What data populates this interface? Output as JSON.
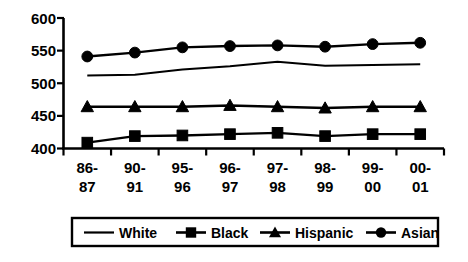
{
  "chart_data": {
    "type": "line",
    "title": "",
    "subtitle": "",
    "xlabel": "",
    "ylabel": "",
    "categories": [
      "86-\n87",
      "90-\n91",
      "95-\n96",
      "96-\n97",
      "97-\n98",
      "98-\n99",
      "99-\n00",
      "00-\n01"
    ],
    "category_lines": [
      [
        "86-",
        "87"
      ],
      [
        "90-",
        "91"
      ],
      [
        "95-",
        "96"
      ],
      [
        "96-",
        "97"
      ],
      [
        "97-",
        "98"
      ],
      [
        "98-",
        "99"
      ],
      [
        "99-",
        "00"
      ],
      [
        "00-",
        "01"
      ]
    ],
    "ylim": [
      400,
      600
    ],
    "ytick_values": [
      400,
      450,
      500,
      550,
      600
    ],
    "ytick_labels": [
      "400",
      "450",
      "500",
      "550",
      "600"
    ],
    "grid": false,
    "legend_position": "bottom",
    "series": [
      {
        "name": "White",
        "marker": "none",
        "color": "#000000",
        "values": [
          512,
          513,
          521,
          526,
          533,
          527,
          528,
          529
        ]
      },
      {
        "name": "Black",
        "marker": "square",
        "color": "#000000",
        "values": [
          409,
          419,
          420,
          422,
          424,
          419,
          422,
          422
        ]
      },
      {
        "name": "Hispanic",
        "marker": "triangle",
        "color": "#000000",
        "values": [
          464,
          464,
          464,
          466,
          464,
          462,
          464,
          464
        ]
      },
      {
        "name": "Asian",
        "marker": "circle",
        "color": "#000000",
        "values": [
          541,
          547,
          555,
          557,
          558,
          556,
          560,
          562
        ]
      }
    ]
  },
  "legend": {
    "items": [
      {
        "label": "White",
        "marker": "none"
      },
      {
        "label": "Black",
        "marker": "square"
      },
      {
        "label": "Hispanic",
        "marker": "triangle"
      },
      {
        "label": "Asian",
        "marker": "circle"
      }
    ]
  }
}
